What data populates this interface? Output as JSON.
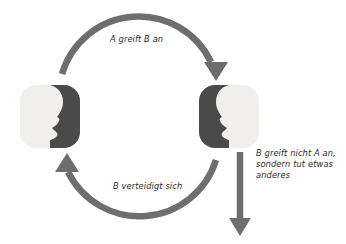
{
  "diagram": {
    "colors": {
      "arrow": "#6e6e6e",
      "icon_dark": "#4a4a4a",
      "icon_light": "#f0efec",
      "text": "#2b2b2b",
      "background": "#ffffff"
    },
    "nodes": [
      {
        "id": "person-a",
        "name": "Person A",
        "icon": "face-profile-right-icon",
        "facing": "right"
      },
      {
        "id": "person-b",
        "name": "Person B",
        "icon": "face-profile-left-icon",
        "facing": "left"
      }
    ],
    "arrows": [
      {
        "id": "attack",
        "icon": "curved-arrow-right-icon",
        "from": "person-a",
        "to": "person-b",
        "label": "A greift B an"
      },
      {
        "id": "defend",
        "icon": "curved-arrow-left-icon",
        "from": "person-b",
        "to": "person-a",
        "label": "B verteidigt sich"
      },
      {
        "id": "not-attack",
        "icon": "straight-arrow-down-icon",
        "from": "person-b",
        "to": null,
        "label_lines": [
          "B greift nicht A an,",
          "sondern tut etwas",
          "anderes"
        ]
      }
    ]
  }
}
